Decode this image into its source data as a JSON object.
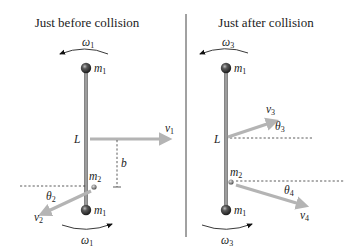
{
  "panels": [
    {
      "title": "Just before collision",
      "omega_top": {
        "sym": "ω",
        "sub": "1",
        "direction": "counterclockwise"
      },
      "omega_bottom": {
        "sym": "ω",
        "sub": "1",
        "direction": "clockwise"
      },
      "top_mass": {
        "sym": "m",
        "sub": "1"
      },
      "bottom_mass": {
        "sym": "m",
        "sub": "1"
      },
      "rod_label": "L",
      "small_mass": {
        "sym": "m",
        "sub": "2"
      },
      "velocity_in": {
        "sym": "v",
        "sub": "1"
      },
      "impact_parameter": "b",
      "velocity_out": {
        "sym": "v",
        "sub": "2"
      },
      "angle": {
        "sym": "θ",
        "sub": "2"
      }
    },
    {
      "title": "Just after collision",
      "omega_top": {
        "sym": "ω",
        "sub": "3",
        "direction": "counterclockwise"
      },
      "omega_bottom": {
        "sym": "ω",
        "sub": "3",
        "direction": "clockwise"
      },
      "top_mass": {
        "sym": "m",
        "sub": "1"
      },
      "bottom_mass": {
        "sym": "m",
        "sub": "1"
      },
      "rod_label": "L",
      "small_mass": {
        "sym": "m",
        "sub": "2"
      },
      "velocity_a": {
        "sym": "v",
        "sub": "3"
      },
      "angle_a": {
        "sym": "θ",
        "sub": "3"
      },
      "velocity_b": {
        "sym": "v",
        "sub": "4"
      },
      "angle_b": {
        "sym": "θ",
        "sub": "4"
      }
    }
  ],
  "colors": {
    "vector_arrow": "#b4b4b4",
    "rod": "#9c9c9c",
    "mass_ball": "#3a3a3a",
    "text": "#222222"
  }
}
